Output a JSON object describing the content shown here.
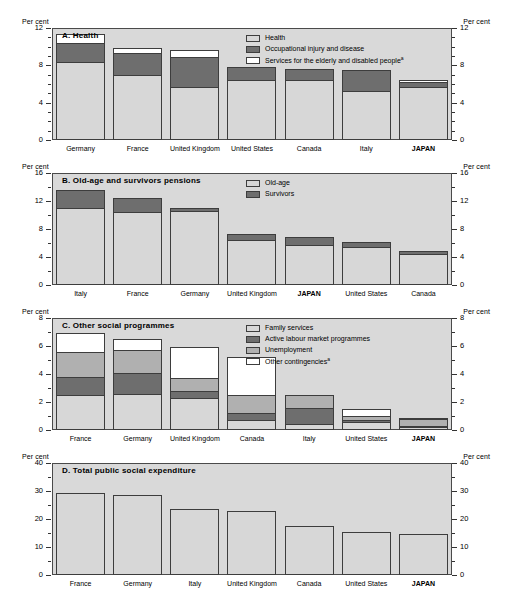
{
  "units": {
    "left": "Per cent",
    "right": "Per cent"
  },
  "panels": [
    {
      "id": "A",
      "title": "A.  Health",
      "axis": {
        "min": 0,
        "max": 12,
        "major_ticks": [
          0,
          4,
          8,
          12
        ],
        "minor_step": 1
      },
      "legend": [
        {
          "label": "Health",
          "fill": "#d7d7d7"
        },
        {
          "label": "Occupational injury and disease",
          "fill": "#6e6e6e"
        },
        {
          "label": "Services for the elderly and disabled people",
          "footnote": "a",
          "fill": "#ffffff"
        }
      ],
      "categories": [
        "Germany",
        "France",
        "United Kingdom",
        "United States",
        "Canada",
        "Italy",
        "JAPAN"
      ],
      "highlight": "JAPAN",
      "series": [
        {
          "name": "Health",
          "values": [
            8.4,
            7.0,
            5.7,
            6.4,
            6.4,
            5.2,
            5.7
          ]
        },
        {
          "name": "Occupational injury and disease",
          "values": [
            2.0,
            2.3,
            3.2,
            1.4,
            1.2,
            2.3,
            0.5
          ]
        },
        {
          "name": "Services for the elderly and disabled people",
          "values": [
            1.0,
            0.6,
            0.7,
            0.0,
            0.0,
            0.0,
            0.2
          ]
        }
      ],
      "totals": [
        11.4,
        9.9,
        9.6,
        7.8,
        7.6,
        7.5,
        6.4
      ]
    },
    {
      "id": "B",
      "title": "B.  Old-age and survivors pensions",
      "axis": {
        "min": 0,
        "max": 16,
        "major_ticks": [
          0,
          4,
          8,
          12,
          16
        ],
        "minor_step": 2
      },
      "legend": [
        {
          "label": "Old-age",
          "fill": "#d7d7d7"
        },
        {
          "label": "Survivors",
          "fill": "#6e6e6e"
        }
      ],
      "categories": [
        "Italy",
        "France",
        "Germany",
        "United Kingdom",
        "JAPAN",
        "United States",
        "Canada"
      ],
      "highlight": "JAPAN",
      "series": [
        {
          "name": "Old-age",
          "values": [
            11.0,
            10.5,
            10.6,
            6.5,
            5.7,
            5.4,
            4.4
          ]
        },
        {
          "name": "Survivors",
          "values": [
            2.6,
            1.9,
            0.4,
            0.8,
            1.1,
            0.8,
            0.4
          ]
        }
      ],
      "totals": [
        13.6,
        12.4,
        11.0,
        7.3,
        6.8,
        6.2,
        4.8
      ]
    },
    {
      "id": "C",
      "title": "C.  Other social programmes",
      "axis": {
        "min": 0,
        "max": 8,
        "major_ticks": [
          0,
          2,
          4,
          6,
          8
        ],
        "minor_step": 1
      },
      "legend": [
        {
          "label": "Family services",
          "fill": "#d7d7d7"
        },
        {
          "label": "Active labour market programmes",
          "fill": "#6e6e6e"
        },
        {
          "label": "Unemployment",
          "fill": "#b0b0b0"
        },
        {
          "label": "Other contingencies",
          "footnote": "a",
          "fill": "#ffffff"
        }
      ],
      "categories": [
        "France",
        "Germany",
        "United Kingdom",
        "Canada",
        "Italy",
        "United States",
        "JAPAN"
      ],
      "highlight": "JAPAN",
      "series": [
        {
          "name": "Family services",
          "values": [
            2.5,
            2.6,
            2.3,
            0.7,
            0.4,
            0.6,
            0.2
          ]
        },
        {
          "name": "Active labour market programmes",
          "values": [
            1.3,
            1.5,
            0.5,
            0.5,
            1.2,
            0.15,
            0.1
          ]
        },
        {
          "name": "Unemployment",
          "values": [
            1.8,
            1.6,
            0.9,
            1.3,
            0.9,
            0.25,
            0.5
          ]
        },
        {
          "name": "Other contingencies",
          "values": [
            1.3,
            0.8,
            2.2,
            2.7,
            0.0,
            0.5,
            0.05
          ]
        }
      ],
      "totals": [
        6.9,
        6.5,
        5.9,
        5.2,
        2.5,
        1.5,
        0.85
      ]
    },
    {
      "id": "D",
      "title": "D.  Total public social expenditure",
      "axis": {
        "min": 0,
        "max": 40,
        "major_ticks": [
          0,
          10,
          20,
          30,
          40
        ],
        "minor_step": 5
      },
      "legend": [],
      "categories": [
        "France",
        "Germany",
        "Italy",
        "United Kingdom",
        "Canada",
        "United States",
        "JAPAN"
      ],
      "highlight": "JAPAN",
      "series": [
        {
          "name": "Total public social expenditure",
          "values": [
            29.2,
            28.6,
            23.6,
            22.8,
            17.6,
            15.5,
            14.5
          ]
        }
      ],
      "totals": [
        29.2,
        28.6,
        23.6,
        22.8,
        17.6,
        15.5,
        14.5
      ]
    }
  ],
  "chart_data": {
    "type": "bar",
    "ylabel": "Per cent",
    "xlabel": "",
    "grid": false,
    "stacked": true,
    "panels": [
      {
        "panel": "A",
        "title": "A.  Health",
        "ylim": [
          0,
          12
        ],
        "yticks": [
          0,
          4,
          8,
          12
        ],
        "legend_position": "top-right",
        "categories": [
          "Germany",
          "France",
          "United Kingdom",
          "United States",
          "Canada",
          "Italy",
          "JAPAN"
        ],
        "series": [
          {
            "name": "Health",
            "values": [
              8.4,
              7.0,
              5.7,
              6.4,
              6.4,
              5.2,
              5.7
            ]
          },
          {
            "name": "Occupational injury and disease",
            "values": [
              2.0,
              2.3,
              3.2,
              1.4,
              1.2,
              2.3,
              0.5
            ]
          },
          {
            "name": "Services for the elderly and disabled people",
            "values": [
              1.0,
              0.6,
              0.7,
              0.0,
              0.0,
              0.0,
              0.2
            ]
          }
        ],
        "totals": [
          11.4,
          9.9,
          9.6,
          7.8,
          7.6,
          7.5,
          6.4
        ]
      },
      {
        "panel": "B",
        "title": "B.  Old-age and survivors pensions",
        "ylim": [
          0,
          16
        ],
        "yticks": [
          0,
          4,
          8,
          12,
          16
        ],
        "legend_position": "top-right",
        "categories": [
          "Italy",
          "France",
          "Germany",
          "United Kingdom",
          "JAPAN",
          "United States",
          "Canada"
        ],
        "series": [
          {
            "name": "Old-age",
            "values": [
              11.0,
              10.5,
              10.6,
              6.5,
              5.7,
              5.4,
              4.4
            ]
          },
          {
            "name": "Survivors",
            "values": [
              2.6,
              1.9,
              0.4,
              0.8,
              1.1,
              0.8,
              0.4
            ]
          }
        ],
        "totals": [
          13.6,
          12.4,
          11.0,
          7.3,
          6.8,
          6.2,
          4.8
        ]
      },
      {
        "panel": "C",
        "title": "C.  Other social programmes",
        "ylim": [
          0,
          8
        ],
        "yticks": [
          0,
          2,
          4,
          6,
          8
        ],
        "legend_position": "top-right",
        "categories": [
          "France",
          "Germany",
          "United Kingdom",
          "Canada",
          "Italy",
          "United States",
          "JAPAN"
        ],
        "series": [
          {
            "name": "Family services",
            "values": [
              2.5,
              2.6,
              2.3,
              0.7,
              0.4,
              0.6,
              0.2
            ]
          },
          {
            "name": "Active labour market programmes",
            "values": [
              1.3,
              1.5,
              0.5,
              0.5,
              1.2,
              0.15,
              0.1
            ]
          },
          {
            "name": "Unemployment",
            "values": [
              1.8,
              1.6,
              0.9,
              1.3,
              0.9,
              0.25,
              0.5
            ]
          },
          {
            "name": "Other contingencies",
            "values": [
              1.3,
              0.8,
              2.2,
              2.7,
              0.0,
              0.5,
              0.05
            ]
          }
        ],
        "totals": [
          6.9,
          6.5,
          5.9,
          5.2,
          2.5,
          1.5,
          0.85
        ]
      },
      {
        "panel": "D",
        "title": "D.  Total public social expenditure",
        "ylim": [
          0,
          40
        ],
        "yticks": [
          0,
          10,
          20,
          30,
          40
        ],
        "legend_position": "none",
        "categories": [
          "France",
          "Germany",
          "Italy",
          "United Kingdom",
          "Canada",
          "United States",
          "JAPAN"
        ],
        "series": [
          {
            "name": "Total public social expenditure",
            "values": [
              29.2,
              28.6,
              23.6,
              22.8,
              17.6,
              15.5,
              14.5
            ]
          }
        ],
        "totals": [
          29.2,
          28.6,
          23.6,
          22.8,
          17.6,
          15.5,
          14.5
        ]
      }
    ]
  }
}
